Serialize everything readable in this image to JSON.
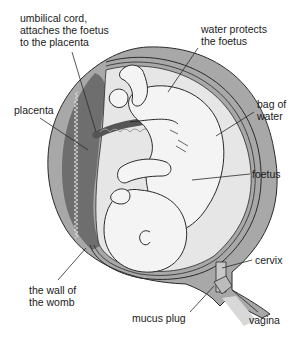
{
  "diagram": {
    "labels": {
      "umbilical_cord": "umbilical cord,\nattaches the foetus\nto the placenta",
      "water_protects": "water protects\nthe foetus",
      "placenta": "placenta",
      "bag_of_water": "bag of\nwater",
      "foetus": "foetus",
      "cervix": "cervix",
      "wall_of_womb": "the wall of\nthe womb",
      "mucus_plug": "mucus plug",
      "vagina": "vagina"
    },
    "colors": {
      "womb_wall": "#8c8c8c",
      "womb_wall_light": "#b4b4b4",
      "placenta": "#6e6e6e",
      "amniotic_fluid": "#e6e6e6",
      "foetus": "#f4f4f4",
      "outline": "#2a2a2a",
      "text": "#1a1a1a"
    }
  }
}
